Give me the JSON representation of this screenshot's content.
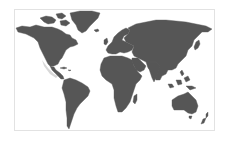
{
  "map": {
    "type": "world-map-silhouette",
    "projection": "equirectangular-like",
    "land_color": "#565656",
    "ocean_color": "#ffffff",
    "frame_border_color": "#e2e2e2",
    "regions": [
      "north-america",
      "greenland",
      "central-america",
      "south-america",
      "europe",
      "africa",
      "madagascar",
      "asia",
      "arabian-peninsula",
      "indian-subcontinent",
      "southeast-asia-islands",
      "japan",
      "australia",
      "new-zealand",
      "arctic-islands"
    ]
  }
}
